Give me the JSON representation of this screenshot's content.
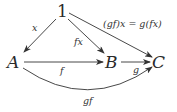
{
  "diagram": {
    "objects": {
      "one": "1",
      "a": "A",
      "b": "B",
      "c": "C"
    },
    "arrows": [
      {
        "id": "x",
        "from": "1",
        "to": "A",
        "label": "x"
      },
      {
        "id": "fx",
        "from": "1",
        "to": "B",
        "label": "fx"
      },
      {
        "id": "gfx",
        "from": "1",
        "to": "C",
        "label": "(gf)x = g(fx)"
      },
      {
        "id": "f",
        "from": "A",
        "to": "B",
        "label": "f"
      },
      {
        "id": "g",
        "from": "B",
        "to": "C",
        "label": "g"
      },
      {
        "id": "gf",
        "from": "A",
        "to": "C",
        "label": "gf",
        "curved": true
      }
    ],
    "stroke_color": "#333333"
  }
}
